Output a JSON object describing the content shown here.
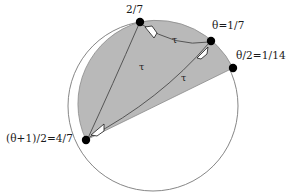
{
  "figure": {
    "type": "circle-lamination-diagram",
    "background_color": "#ffffff",
    "shaded_region_color": "#b9b9b9",
    "outline_color": "#6e6e6e",
    "point_color": "#000000",
    "arrowhead_fill": "#ffffff",
    "arrowhead_stroke": "#1a1a1a"
  },
  "circle": {
    "center_x": 153,
    "center_y": 106,
    "radius": 85
  },
  "points": [
    {
      "id": "p-two-sevenths",
      "label": "2/7",
      "x": 140,
      "y": 22,
      "angle_fraction": "2/7"
    },
    {
      "id": "p-theta",
      "label": "θ=1/7",
      "x": 211,
      "y": 41,
      "angle_fraction": "1/7"
    },
    {
      "id": "p-theta-half",
      "label": "θ/2=1/14",
      "x": 233,
      "y": 68,
      "angle_fraction": "1/14"
    },
    {
      "id": "p-theta-plus-one-half",
      "label": "(θ+1)/2=4/7",
      "x": 86,
      "y": 140,
      "angle_fraction": "4/7"
    }
  ],
  "arrow_labels": [
    {
      "id": "tau-upper-arc",
      "label": "τ"
    },
    {
      "id": "tau-middle-chord",
      "label": "τ"
    },
    {
      "id": "tau-lower-chord",
      "label": "τ"
    }
  ],
  "accent_colors": {
    "shading": "#b9b9b9",
    "curve": "#3a3a3a",
    "circle_outline": "#707070"
  }
}
